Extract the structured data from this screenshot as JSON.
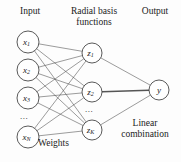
{
  "figure": {
    "background_color": "#fdfdfd",
    "line_color": "#4a4a4a",
    "node_fill": "#ffffff",
    "node_stroke": "#3c3c3c",
    "text_color": "#1b1b1b"
  },
  "headers": {
    "input": "Input",
    "hidden_line1": "Radial basis",
    "hidden_line2": "functions",
    "output": "Output"
  },
  "annotations": {
    "weights": "Weights",
    "linear_line1": "Linear",
    "linear_line2": "combination",
    "input_ellipsis": "...",
    "hidden_ellipsis": "..."
  },
  "layers": {
    "input": {
      "name": "Input",
      "nodes": [
        {
          "id": "x1",
          "base": "x",
          "sub": "1",
          "cx": 28,
          "cy": 42,
          "r": 11
        },
        {
          "id": "x2",
          "base": "x",
          "sub": "2",
          "cx": 28,
          "cy": 70,
          "r": 11
        },
        {
          "id": "x3",
          "base": "x",
          "sub": "3",
          "cx": 28,
          "cy": 98,
          "r": 11
        },
        {
          "id": "xN",
          "base": "x",
          "sub": "N",
          "cx": 28,
          "cy": 137,
          "r": 11
        }
      ]
    },
    "hidden": {
      "name": "Radial basis functions",
      "nodes": [
        {
          "id": "z1",
          "base": "z",
          "sub": "1",
          "cx": 92,
          "cy": 53,
          "r": 10
        },
        {
          "id": "z2",
          "base": "z",
          "sub": "2",
          "cx": 92,
          "cy": 92,
          "r": 10
        },
        {
          "id": "zK",
          "base": "z",
          "sub": "K",
          "cx": 92,
          "cy": 130,
          "r": 10
        }
      ]
    },
    "output": {
      "name": "Output",
      "nodes": [
        {
          "id": "y",
          "base": "y",
          "sub": "",
          "cx": 159,
          "cy": 90,
          "r": 10
        }
      ]
    }
  },
  "edges": {
    "input_to_hidden_label": "Weights",
    "hidden_to_output_label": "Linear combination",
    "input_to_hidden": [
      [
        "x1",
        "z1"
      ],
      [
        "x1",
        "z2"
      ],
      [
        "x1",
        "zK"
      ],
      [
        "x2",
        "z1"
      ],
      [
        "x2",
        "z2"
      ],
      [
        "x2",
        "zK"
      ],
      [
        "x3",
        "z1"
      ],
      [
        "x3",
        "z2"
      ],
      [
        "x3",
        "zK"
      ],
      [
        "xN",
        "z1"
      ],
      [
        "xN",
        "z2"
      ],
      [
        "xN",
        "zK"
      ]
    ],
    "hidden_to_output": [
      [
        "z1",
        "y"
      ],
      [
        "z2",
        "y"
      ],
      [
        "zK",
        "y"
      ]
    ],
    "emphasized": [
      "z2",
      "y"
    ]
  }
}
